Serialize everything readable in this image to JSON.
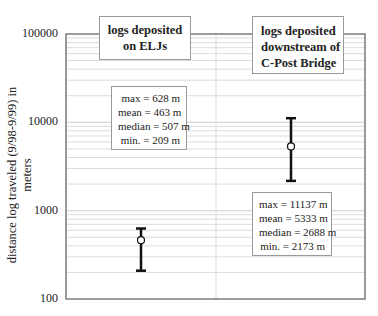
{
  "chart_data": {
    "type": "errorbar",
    "title": "",
    "xlabel": "",
    "ylabel": "distance log traveled (9/98-9/99) in meters",
    "yscale": "log",
    "ylim": [
      100,
      100000
    ],
    "yticks": [
      "100000",
      "10000",
      "1000",
      "100"
    ],
    "grid": true,
    "categories": [
      "logs deposited on ELJs",
      "logs deposited downstream of C-Post Bridge"
    ],
    "series": [
      {
        "name": "logs deposited on ELJs",
        "max": 628,
        "mean": 463,
        "median": 507,
        "min": 209,
        "unit": "m"
      },
      {
        "name": "logs deposited downstream of C-Post Bridge",
        "max": 11137,
        "mean": 5333,
        "median": 2688,
        "min": 2173,
        "unit": "m"
      }
    ]
  },
  "labels": {
    "y_axis": "distance log traveled (9/98-9/99) in meters",
    "ticks": {
      "t100000": "100000",
      "t10000": "10000",
      "t1000": "1000",
      "t100": "100"
    },
    "cat1": {
      "line1": "logs deposited",
      "line2": "on ELJs"
    },
    "cat2": {
      "line1": "logs deposited",
      "line2": "downstream of",
      "line3": "C-Post Bridge"
    },
    "stats1": {
      "max": "max = 628 m",
      "mean": "mean = 463 m",
      "median": "median = 507 m",
      "min": "min. = 209 m"
    },
    "stats2": {
      "max": "max = 11137 m",
      "mean": "mean = 5333 m",
      "median": "median = 2688 m",
      "min": "min. = 2173 m"
    }
  },
  "colors": {
    "axis": "#555555",
    "grid": "#dcdcdc",
    "bar": "#111111",
    "box_border": "#9a9a9a"
  }
}
